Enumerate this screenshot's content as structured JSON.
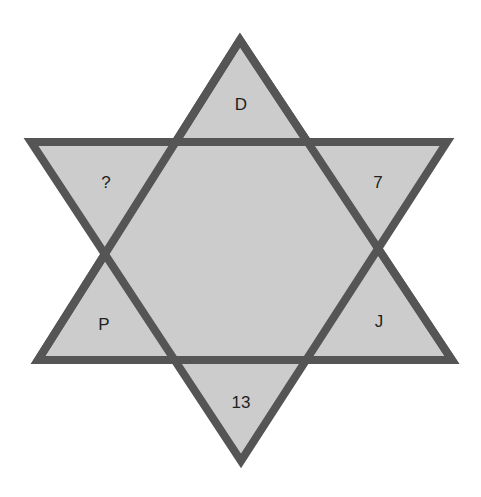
{
  "diagram": {
    "type": "hexagram-number-puzzle",
    "colors": {
      "fill": "#cccccc",
      "stroke": "#555555",
      "background": "#ffffff",
      "text": "#222222"
    },
    "labels": {
      "top": "D",
      "upper_left": "?",
      "upper_right": "7",
      "lower_left": "P",
      "lower_right": "J",
      "bottom": "13"
    }
  }
}
